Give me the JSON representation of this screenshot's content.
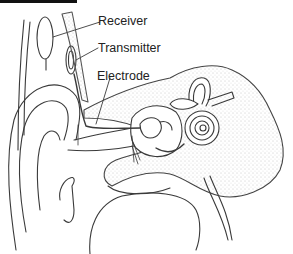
{
  "diagram": {
    "labels": [
      {
        "id": "receiver",
        "text": "Receiver"
      },
      {
        "id": "transmitter",
        "text": "Transmitter"
      },
      {
        "id": "electrode",
        "text": "Electrode"
      }
    ],
    "colors": {
      "line": "#3a3a3a",
      "stipple": "#8a8a8a",
      "background": "#ffffff",
      "top_bar": "#111111"
    }
  }
}
